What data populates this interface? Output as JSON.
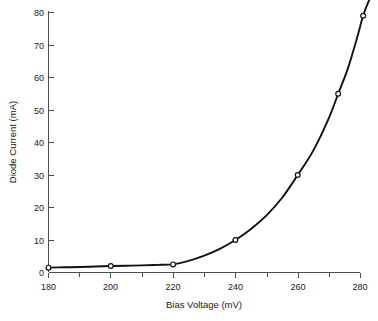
{
  "chart_data": {
    "type": "line",
    "title": "",
    "xlabel": "Bias Voltage (mV)",
    "ylabel": "Diode Current (mA)",
    "xlim": [
      180,
      283
    ],
    "ylim": [
      0,
      83
    ],
    "grid": false,
    "legend": null,
    "x_major_ticks": [
      180,
      200,
      220,
      240,
      260,
      280
    ],
    "x_major_tick_labels": [
      "180",
      "200",
      "220",
      "240",
      "260",
      "280"
    ],
    "x_minor_ticks": [
      190,
      210,
      230,
      250,
      270
    ],
    "y_major_ticks": [
      0,
      10,
      20,
      30,
      40,
      50,
      60,
      70,
      80
    ],
    "y_major_tick_labels": [
      "0",
      "10",
      "20",
      "30",
      "40",
      "50",
      "60",
      "70",
      "80"
    ],
    "marker_style": "open-circle",
    "line_color": "#111111",
    "marker_face_color": "#ffffff",
    "marker_edge_color": "#111111",
    "axis_color": "#4d4d4d",
    "background_color": "#ffffff",
    "series": [
      {
        "name": "Diode Current",
        "x": [
          180,
          200,
          220,
          240,
          260,
          273,
          281
        ],
        "y": [
          1.5,
          2.0,
          2.5,
          10.0,
          30.0,
          55.0,
          79.0
        ]
      }
    ],
    "curve_points": {
      "x": [
        180,
        185,
        190,
        195,
        200,
        205,
        210,
        215,
        220,
        225,
        230,
        235,
        240,
        245,
        250,
        255,
        260,
        265,
        270,
        273,
        276,
        279,
        281,
        283
      ],
      "y": [
        1.5,
        1.6,
        1.7,
        1.85,
        2.0,
        2.1,
        2.2,
        2.35,
        2.5,
        3.6,
        5.2,
        7.3,
        10.0,
        13.4,
        17.6,
        23.0,
        30.0,
        37.5,
        47.5,
        55.0,
        62.5,
        72.0,
        79.0,
        84.0
      ]
    },
    "annotations": []
  }
}
